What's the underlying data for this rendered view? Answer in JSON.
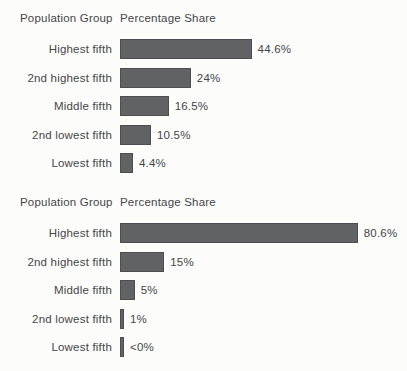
{
  "figure": {
    "background_color": "#fcfcfa",
    "bar_fill_color": "#616264",
    "bar_border_color": "#4d4e51",
    "text_color": "#45464a"
  },
  "chart_data": [
    {
      "type": "bar",
      "orientation": "horizontal",
      "column_headers": {
        "group": "Population Group",
        "share": "Percentage Share"
      },
      "xlabel": "Percentage Share",
      "ylabel": "Population Group",
      "categories": [
        "Highest fifth",
        "2nd highest fifth",
        "Middle fifth",
        "2nd lowest fifth",
        "Lowest fifth"
      ],
      "values": [
        44.6,
        24,
        16.5,
        10.5,
        4.4
      ],
      "value_labels": [
        "44.6%",
        "24%",
        "16.5%",
        "10.5%",
        "4.4%"
      ],
      "xlim": [
        0,
        100
      ],
      "grid": false,
      "legend": false
    },
    {
      "type": "bar",
      "orientation": "horizontal",
      "column_headers": {
        "group": "Population Group",
        "share": "Percentage Share"
      },
      "xlabel": "Percentage Share",
      "ylabel": "Population Group",
      "categories": [
        "Highest fifth",
        "2nd highest fifth",
        "Middle fifth",
        "2nd lowest fifth",
        "Lowest fifth"
      ],
      "values": [
        80.6,
        15,
        5,
        1,
        0
      ],
      "value_labels": [
        "80.6%",
        "15%",
        "5%",
        "1%",
        "<0%"
      ],
      "xlim": [
        0,
        100
      ],
      "grid": false,
      "legend": false
    }
  ]
}
